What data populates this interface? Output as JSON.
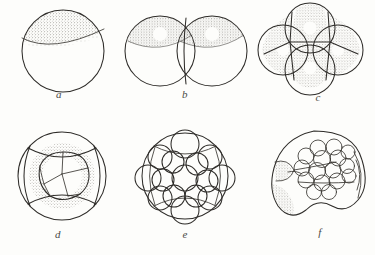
{
  "plate": {
    "title": "Cleavage stages of the embryo",
    "style": "pen-and-ink stipple line drawing",
    "background_color": "#fdfdfb",
    "ink_color": "#2e2c29",
    "stipple_color": "#6f6c66",
    "figure_count": 6
  },
  "figures": [
    {
      "label": "a",
      "name": "fertilized-egg",
      "stage": "one-cell zygote",
      "cell_count": 1,
      "description": "single spherical cell with stippled animal cap separated by a curved boundary line",
      "has_stipple_cap": true,
      "nuclei_visible": 0
    },
    {
      "label": "b",
      "name": "two-cell-stage",
      "stage": "2-cell cleavage",
      "cell_count": 2,
      "description": "two equal blastomeres side by side, each with stippled upper hemisphere and a pale round nucleus",
      "has_stipple_cap": true,
      "nuclei_visible": 2
    },
    {
      "label": "c",
      "name": "four-cell-stage",
      "stage": "4-cell cleavage",
      "cell_count": 4,
      "description": "four blastomeres arranged as a rosette seen from the animal pole, each stippled with a pale nucleus",
      "has_stipple_cap": true,
      "nuclei_visible": 4
    },
    {
      "label": "d",
      "name": "eight-cell-stage",
      "stage": "8-cell cleavage",
      "cell_count": 8,
      "description": "four large outer blastomeres surrounding a central group of smaller cells on a stippled ring",
      "has_stipple_cap": true,
      "nuclei_visible": 0
    },
    {
      "label": "e",
      "name": "morula",
      "stage": "morula",
      "cell_count": 13,
      "description": "mulberry-like cluster of many heavily stippled rounded blastomeres over a smooth outline",
      "has_stipple_cap": true,
      "nuclei_visible": 0
    },
    {
      "label": "f",
      "name": "blastocyst",
      "stage": "blastocyst with inner cell mass",
      "cell_count": 1,
      "description": "irregular sectioned vesicle with an inner cell mass of small cells seen through an opening, stippled at lower left",
      "has_stipple_cap": true,
      "nuclei_visible": 0
    }
  ]
}
